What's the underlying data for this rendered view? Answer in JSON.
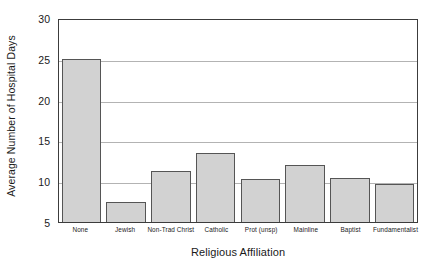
{
  "chart_data": {
    "type": "bar",
    "title": "",
    "subtitle": "",
    "xlabel": "Religious Affiliation",
    "ylabel": "Average Number of Hospital Days",
    "categories": [
      "None",
      "Jewish",
      "Non-Trad Christ",
      "Catholic",
      "Prot (unsp)",
      "Mainline",
      "Baptist",
      "Fundamentalist"
    ],
    "values": [
      25.0,
      7.5,
      11.3,
      13.5,
      10.3,
      12.0,
      10.4,
      9.6
    ],
    "ylim": [
      5,
      30
    ],
    "yticks": [
      5,
      10,
      15,
      20,
      25,
      30
    ],
    "ytick_labels": [
      "5",
      "10",
      "15",
      "20",
      "25",
      "30"
    ],
    "gridlines": [
      10,
      15,
      20,
      25
    ],
    "grid": true,
    "legend": "none",
    "bar_fill_color": "#d2d2d2",
    "bar_edge_color": "#555555",
    "axis_color": "#3c3c3c",
    "grid_color": "#b3b3b3",
    "background_color": "#ffffff"
  }
}
